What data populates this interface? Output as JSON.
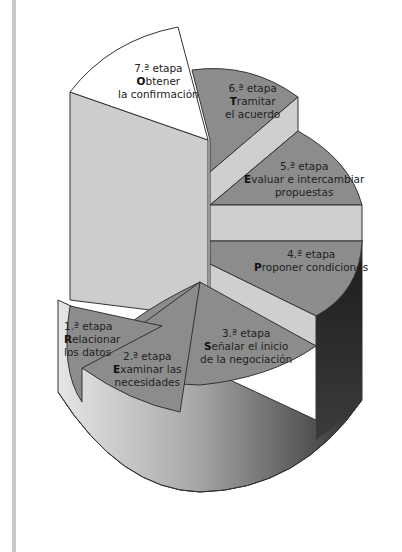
{
  "diagram": {
    "type": "3d-exploded-pie",
    "colors": {
      "slice_dark": "#8c8c8c",
      "slice_white": "#ffffff",
      "band_light": "#cfcfcf",
      "side_dark": "#3a3a3a",
      "outline": "#333333",
      "left_bar": "#c9c9c9"
    },
    "stages": [
      {
        "ordinal": "1.ª etapa",
        "initial": "R",
        "rest_line1": "elacionar",
        "line2": "los datos"
      },
      {
        "ordinal": "2.ª etapa",
        "initial": "E",
        "rest_line1": "xaminar las",
        "line2": "necesidades"
      },
      {
        "ordinal": "3.ª etapa",
        "initial": "S",
        "rest_line1": "eñalar el inicio",
        "line2": "de la negociación"
      },
      {
        "ordinal": "4.ª etapa",
        "initial": "P",
        "rest_line1": "roponer condiciones",
        "line2": ""
      },
      {
        "ordinal": "5.ª etapa",
        "initial": "E",
        "rest_line1": "valuar e intercambiar",
        "line2": "propuestas"
      },
      {
        "ordinal": "6.ª etapa",
        "initial": "T",
        "rest_line1": "ramitar",
        "line2": "el acuerdo"
      },
      {
        "ordinal": "7.ª etapa",
        "initial": "O",
        "rest_line1": "btener",
        "line2": "la confirmación"
      }
    ]
  }
}
